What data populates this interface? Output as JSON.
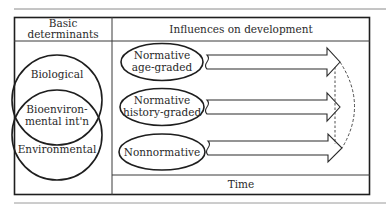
{
  "header": {
    "left_title_line1": "Basic",
    "left_title_line2": "determinants",
    "right_title": "Influences on development"
  },
  "determinants": {
    "top_circle": "Biological",
    "overlap_line1": "Bioenviron-",
    "overlap_line2": "mental int'n",
    "bottom_circle": "Environmental"
  },
  "influences": [
    {
      "line1": "Normative",
      "line2": "age-graded"
    },
    {
      "line1": "Normative",
      "line2": "history-graded"
    },
    {
      "line1": "Nonnormative",
      "line2": ""
    }
  ],
  "footer": {
    "time_label": "Time"
  },
  "colors": {
    "line": "#1e1e1e",
    "rule": "#8a8a8a",
    "text": "#2a2a2a",
    "background": "#ffffff"
  }
}
